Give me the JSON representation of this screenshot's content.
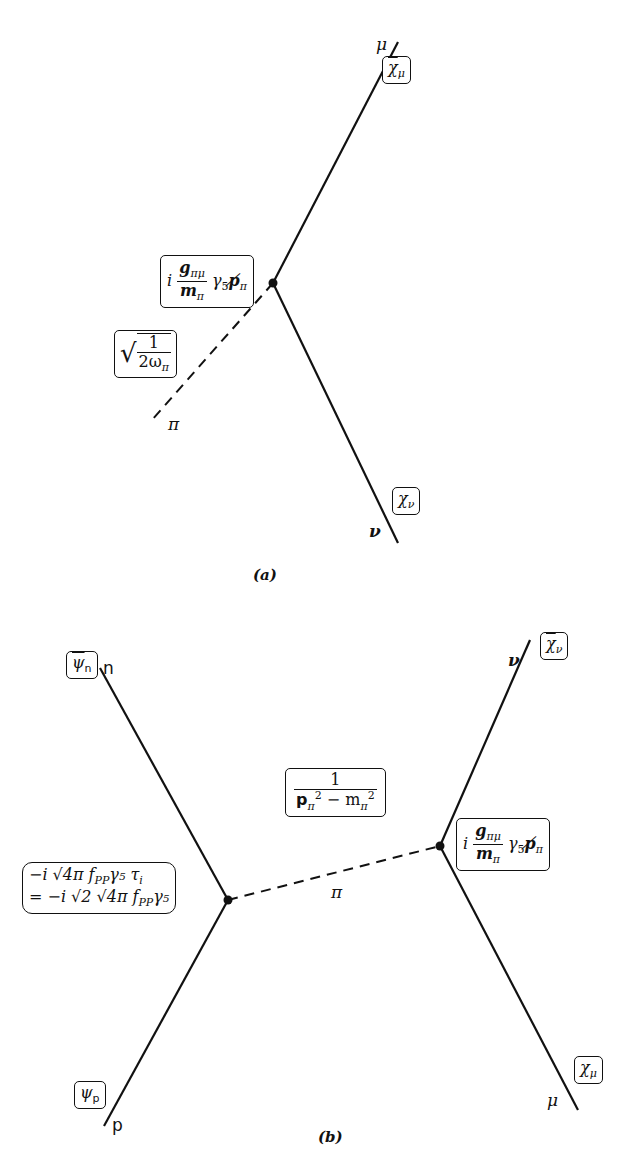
{
  "diagram_a": {
    "caption": "(a)",
    "lines": {
      "mu_label": "μ",
      "nu_label": "ν",
      "pi_label": "π"
    },
    "boxes": {
      "chi_bar_mu": {
        "base": "χ",
        "sub": "μ",
        "overbar": true
      },
      "chi_nu": {
        "base": "χ",
        "sub": "ν"
      },
      "vertex": {
        "prefix": "i",
        "num": "g",
        "num_sub": "πμ",
        "den": "m",
        "den_sub": "π",
        "tail": "γ",
        "tail_sub": "5",
        "slash": "p̸",
        "slash_sub": "π"
      },
      "norm": {
        "num": "1",
        "den": "2ω",
        "den_sub": "π"
      }
    }
  },
  "diagram_b": {
    "caption": "(b)",
    "lines": {
      "n_label": "n",
      "p_label": "p",
      "nu_label": "ν",
      "mu_label": "μ",
      "pi_label": "π"
    },
    "boxes": {
      "psi_bar_n": {
        "base": "ψ",
        "sub": "n",
        "overbar": true
      },
      "psi_p": {
        "base": "ψ",
        "sub": "p"
      },
      "chi_bar_nu": {
        "base": "χ",
        "sub": "ν",
        "overbar": true
      },
      "chi_mu": {
        "base": "χ",
        "sub": "μ"
      },
      "propagator": {
        "num": "1",
        "den_p": "p",
        "den_p_sub": "π",
        "den_p_sup": "2",
        "den_rest": " − m",
        "den_m_sub": "π",
        "den_m_sup": "2"
      },
      "left_vertex": {
        "line1": "−i √4π f",
        "line1_sub": "PP",
        "line1_tail": "γ₅ τ",
        "line1_tail_sub": "i",
        "line2": "= −i √2 √4π f",
        "line2_sub": "PP",
        "line2_tail": "γ₅"
      },
      "right_vertex": {
        "prefix": "i",
        "num": "g",
        "num_sub": "πμ",
        "den": "m",
        "den_sub": "π",
        "tail": "γ",
        "tail_sub": "5",
        "slash": "p̸",
        "slash_sub": "π"
      }
    }
  }
}
